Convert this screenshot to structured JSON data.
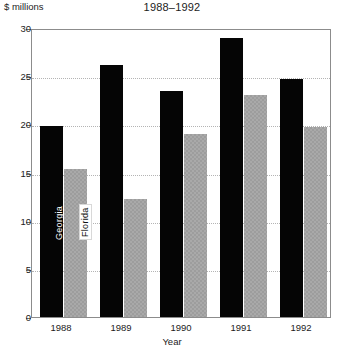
{
  "chart_data": {
    "type": "bar",
    "title": "1988–1992",
    "xlabel": "Year",
    "ylabel": "$ millions",
    "categories": [
      "1988",
      "1989",
      "1990",
      "1991",
      "1992"
    ],
    "series": [
      {
        "name": "Georgia",
        "values": [
          19.8,
          26.2,
          23.5,
          29.0,
          24.7
        ],
        "color": "#050505"
      },
      {
        "name": "Florida",
        "values": [
          15.4,
          12.2,
          19.0,
          23.0,
          19.7
        ],
        "color": "#a9a9a9"
      }
    ],
    "ylim": [
      0,
      30
    ],
    "yticks": [
      0,
      5,
      10,
      15,
      20,
      25,
      30
    ],
    "ytick_labels": [
      "0",
      "5",
      "10",
      "15",
      "20",
      "25",
      "30"
    ],
    "grid": true,
    "grid_axis": "y",
    "legend": "in-bar rotated labels",
    "legend_position": "inside-first-group"
  },
  "axis": {
    "y_caption": "$ millions",
    "x_caption": "Year"
  },
  "series_tags": {
    "georgia": "Georgia",
    "florida": "Florida"
  }
}
